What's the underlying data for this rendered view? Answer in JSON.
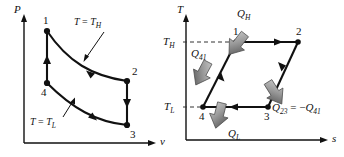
{
  "figure": {
    "colors": {
      "line": "#111111",
      "background": "#ffffff",
      "arrow_fill": "#8a8a8a",
      "dashed": "#333333"
    }
  },
  "pv_diagram": {
    "name": "P-v diagram",
    "y_axis_label": "P",
    "x_axis_label": "v",
    "isotherm_high_label_parts": {
      "t": "T",
      "eq": " = ",
      "th": "T",
      "sub": "H"
    },
    "isotherm_low_label_parts": {
      "t": "T",
      "eq": " = ",
      "tl": "T",
      "sub": "L"
    },
    "isotherm_high_label": "T = TH",
    "isotherm_low_label": "T = TL",
    "states": [
      {
        "name": "state-1",
        "label": "1",
        "x": 47,
        "y": 31
      },
      {
        "name": "state-2",
        "label": "2",
        "x": 127,
        "y": 81
      },
      {
        "name": "state-3",
        "label": "3",
        "x": 127,
        "y": 125
      },
      {
        "name": "state-4",
        "label": "4",
        "x": 47,
        "y": 83
      }
    ],
    "processes": [
      {
        "from": "1",
        "to": "2",
        "type": "isothermal-expansion-TH"
      },
      {
        "from": "2",
        "to": "3",
        "type": "isentropic-expansion"
      },
      {
        "from": "3",
        "to": "4",
        "type": "isothermal-compression-TL"
      },
      {
        "from": "4",
        "to": "1",
        "type": "isentropic-compression"
      }
    ]
  },
  "ts_diagram": {
    "name": "T-s diagram",
    "y_axis_label": "T",
    "x_axis_label": "s",
    "tick_high_label": "TH",
    "tick_low_label": "TL",
    "tick_high_parts": {
      "t": "T",
      "sub": "H"
    },
    "tick_low_parts": {
      "t": "T",
      "sub": "L"
    },
    "heat_in_label": "QH",
    "heat_in_parts": {
      "q": "Q",
      "sub": "H"
    },
    "heat_out_label": "QL",
    "heat_out_parts": {
      "q": "Q",
      "sub": "L"
    },
    "q41_label": "Q41",
    "q41_parts": {
      "q": "Q",
      "sub": "41"
    },
    "q23_equation": "Q23 = -Q41",
    "q23_parts": {
      "q": "Q",
      "sub23": "23",
      "eq": " = ",
      "minus": "−",
      "q2": "Q",
      "sub41": "41"
    },
    "states": [
      {
        "name": "state-1",
        "label": "1",
        "x": 236,
        "y": 42
      },
      {
        "name": "state-2",
        "label": "2",
        "x": 298,
        "y": 42
      },
      {
        "name": "state-3",
        "label": "3",
        "x": 268,
        "y": 107
      },
      {
        "name": "state-4",
        "label": "4",
        "x": 203,
        "y": 107
      }
    ],
    "processes": [
      {
        "from": "1",
        "to": "2",
        "type": "isothermal-heat-addition"
      },
      {
        "from": "2",
        "to": "3",
        "type": "isentropic-expansion"
      },
      {
        "from": "3",
        "to": "4",
        "type": "isothermal-heat-rejection"
      },
      {
        "from": "4",
        "to": "1",
        "type": "isentropic-compression"
      }
    ]
  }
}
